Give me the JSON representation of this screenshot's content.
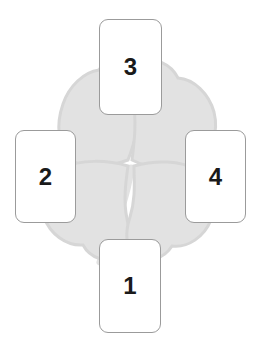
{
  "spread": {
    "name": "Four Card Clover Spread",
    "background_motif": "four-leaf-clover-watermark",
    "layout": "cross",
    "card_count": 4,
    "colors": {
      "page_background": "#ffffff",
      "card_background": "#ffffff",
      "card_border": "#9b9b9b",
      "number_text": "#1a1a1a",
      "clover_fill": "#e2e2e2",
      "clover_outline": "#d2d2d2",
      "stem_fill": "#e2e2e2"
    },
    "cards": [
      {
        "id": "card-bottom",
        "number": "1",
        "position": "bottom"
      },
      {
        "id": "card-left",
        "number": "2",
        "position": "left"
      },
      {
        "id": "card-top",
        "number": "3",
        "position": "top"
      },
      {
        "id": "card-right",
        "number": "4",
        "position": "right"
      }
    ]
  }
}
